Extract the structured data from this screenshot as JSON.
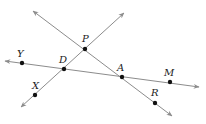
{
  "diagram": {
    "type": "geometry-lines",
    "colors": {
      "line": "#8c8c8c",
      "point": "#111111",
      "label": "#222222"
    },
    "lines": [
      {
        "name": "line-PA",
        "from": [
          33,
          11
        ],
        "to": [
          172,
          116
        ],
        "arrows": "both"
      },
      {
        "name": "line-XP",
        "from": [
          21,
          107
        ],
        "to": [
          124,
          13
        ],
        "arrows": "both"
      },
      {
        "name": "line-YM",
        "from": [
          5,
          61
        ],
        "to": [
          199,
          87
        ],
        "arrows": "both"
      }
    ],
    "points": [
      {
        "label": "P",
        "x": 85,
        "y": 49,
        "lx": 82,
        "ly": 42
      },
      {
        "label": "D",
        "x": 64,
        "y": 69,
        "lx": 59,
        "ly": 63
      },
      {
        "label": "A",
        "x": 122,
        "y": 77,
        "lx": 117,
        "ly": 71
      },
      {
        "label": "Y",
        "x": 22,
        "y": 63,
        "lx": 17,
        "ly": 57
      },
      {
        "label": "M",
        "x": 170,
        "y": 82,
        "lx": 164,
        "ly": 76
      },
      {
        "label": "X",
        "x": 35,
        "y": 95,
        "lx": 32,
        "ly": 89
      },
      {
        "label": "R",
        "x": 155,
        "y": 103,
        "lx": 151,
        "ly": 96
      }
    ]
  }
}
